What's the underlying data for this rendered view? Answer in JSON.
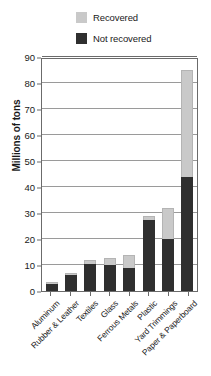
{
  "chart_data": {
    "type": "bar",
    "subtype": "stacked-vertical-bar",
    "title": "",
    "xlabel": "",
    "ylabel": "Millions of tons",
    "ylim": [
      0,
      90
    ],
    "yticks": [
      0,
      10,
      20,
      30,
      40,
      50,
      60,
      70,
      80,
      90
    ],
    "ytick_labels": [
      "0",
      "10",
      "20",
      "30",
      "40",
      "50",
      "60",
      "70",
      "80",
      "90"
    ],
    "grid": true,
    "grid_axis": "y",
    "legend_position": "top-center",
    "categories": [
      "Aluminum",
      "Rubber & Leather",
      "Textiles",
      "Glass",
      "Ferrous Metals",
      "Plastic",
      "Yard Trimmings",
      "Paper & Paperboard"
    ],
    "series": [
      {
        "name": "Not recovered",
        "color": "#2f2f2f",
        "values": [
          2.7,
          6.2,
          10.5,
          10.0,
          9.0,
          27.5,
          20.0,
          44.0
        ]
      },
      {
        "name": "Recovered",
        "color": "#c9c9c9",
        "values": [
          0.7,
          0.8,
          1.5,
          2.8,
          5.0,
          1.5,
          12.0,
          41.0
        ]
      }
    ],
    "totals": [
      3.4,
      7.0,
      12.0,
      12.8,
      14.0,
      29.0,
      32.0,
      85.0
    ]
  },
  "legend": {
    "items": [
      {
        "label": "Recovered",
        "color": "#c9c9c9"
      },
      {
        "label": "Not recovered",
        "color": "#2f2f2f"
      }
    ]
  }
}
